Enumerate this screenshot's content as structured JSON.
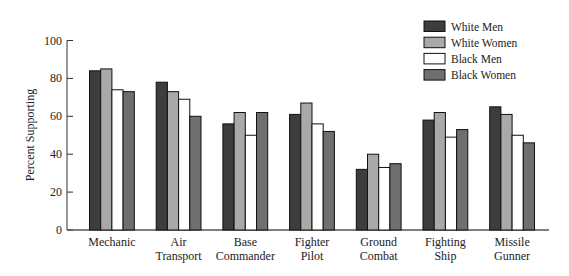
{
  "chart_data": {
    "type": "bar",
    "title": "",
    "xlabel": "",
    "ylabel": "Percent Supporting",
    "ylim": [
      0,
      100
    ],
    "yticks": [
      0,
      20,
      40,
      60,
      80,
      100
    ],
    "grid": false,
    "legend_position": "top-right",
    "categories": [
      [
        "Mechanic"
      ],
      [
        "Air",
        "Transport"
      ],
      [
        "Base",
        "Commander"
      ],
      [
        "Fighter",
        "Pilot"
      ],
      [
        "Ground",
        "Combat"
      ],
      [
        "Fighting",
        "Ship"
      ],
      [
        "Missile",
        "Gunner"
      ]
    ],
    "series": [
      {
        "name": "White Men",
        "color": "#3d3d3d",
        "values": [
          84,
          78,
          56,
          61,
          32,
          58,
          65
        ]
      },
      {
        "name": "White Women",
        "color": "#a9a9a9",
        "values": [
          85,
          73,
          62,
          67,
          40,
          62,
          61
        ]
      },
      {
        "name": "Black Men",
        "color": "#ffffff",
        "values": [
          74,
          69,
          50,
          56,
          33,
          49,
          50
        ]
      },
      {
        "name": "Black Women",
        "color": "#6f6f6f",
        "values": [
          73,
          60,
          62,
          52,
          35,
          53,
          46
        ]
      }
    ]
  }
}
